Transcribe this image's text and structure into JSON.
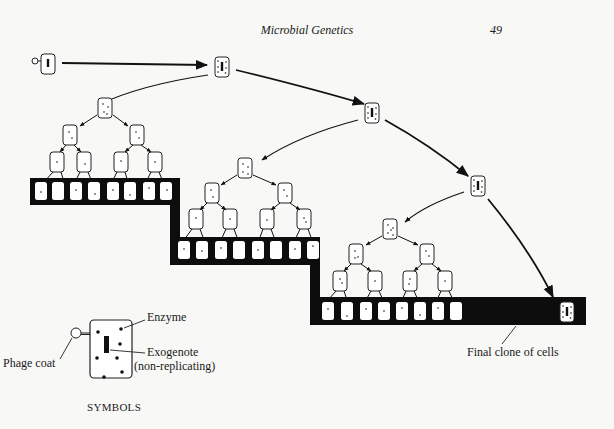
{
  "header": {
    "title": "Microbial Genetics",
    "page_number": "49"
  },
  "labels": {
    "final_clone": "Final clone of cells"
  },
  "legend": {
    "title": "SYMBOLS",
    "enzyme": "Enzyme",
    "exogenote": "Exogenote",
    "exogenote_note": "(non-replicating)",
    "phage_coat": "Phage coat"
  },
  "colors": {
    "ink": "#111111",
    "paper": "#f8f8f6",
    "band": "#0d0d0d"
  },
  "diagram": {
    "generations": [
      {
        "mother_cell": [
          222,
          67
        ],
        "tree_root": [
          78,
          108
        ],
        "band_y": 178
      },
      {
        "mother_cell": [
          372,
          113
        ],
        "tree_root": [
          243,
          168
        ],
        "band_y": 237
      },
      {
        "mother_cell": [
          478,
          186
        ],
        "tree_root": [
          388,
          229
        ],
        "band_y": 297
      }
    ],
    "final_cell": [
      567,
      312
    ]
  }
}
